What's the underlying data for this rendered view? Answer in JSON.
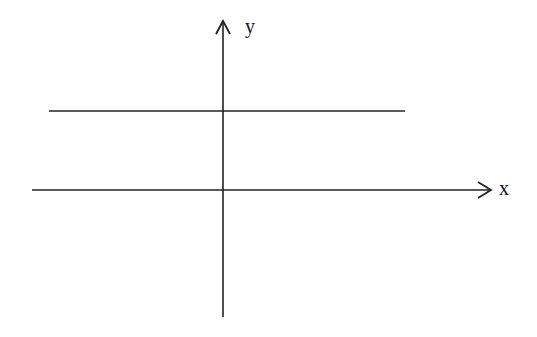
{
  "diagram": {
    "type": "coordinate-axes",
    "x_axis": {
      "label": "x",
      "from": [
        32,
        190
      ],
      "to": [
        491,
        190
      ]
    },
    "y_axis": {
      "label": "y",
      "from": [
        223,
        317
      ],
      "to": [
        223,
        20
      ]
    },
    "lines": [
      {
        "name": "horizontal-line",
        "from": [
          49,
          111
        ],
        "to": [
          405,
          111
        ],
        "description": "horizontal line above x-axis (y = constant)"
      }
    ],
    "stroke_color": "#222222",
    "background": "#ffffff"
  }
}
